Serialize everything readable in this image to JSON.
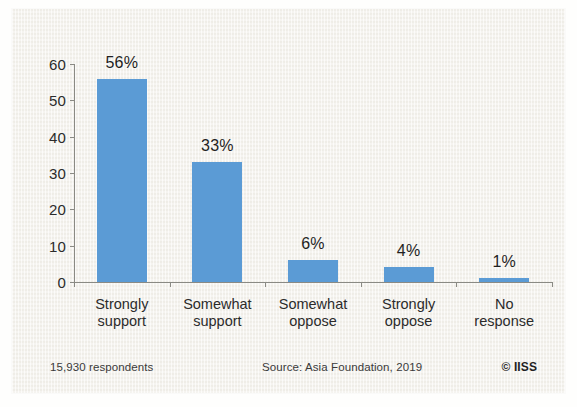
{
  "chart_data": {
    "type": "bar",
    "title": "",
    "subtitle": "",
    "xlabel": "",
    "ylabel": "",
    "ylim": [
      0,
      60
    ],
    "yticks": [
      0,
      10,
      20,
      30,
      40,
      50,
      60
    ],
    "ytick_labels": [
      "0",
      "10",
      "20",
      "30",
      "40",
      "50",
      "60"
    ],
    "grid": false,
    "legend": null,
    "categories": [
      "Strongly support",
      "Somewhat support",
      "Somewhat oppose",
      "Strongly oppose",
      "No response"
    ],
    "category_lines": [
      [
        "Strongly",
        "support"
      ],
      [
        "Somewhat",
        "support"
      ],
      [
        "Somewhat",
        "oppose"
      ],
      [
        "Strongly",
        "oppose"
      ],
      [
        "No",
        "response"
      ]
    ],
    "values": [
      56,
      33,
      6,
      4,
      1
    ],
    "data_labels": [
      "56%",
      "33%",
      "6%",
      "4%",
      "1%"
    ],
    "bar_color": "#5b9bd5"
  },
  "footer": {
    "respondents": "15,930 respondents",
    "source": "Source: Asia Foundation, 2019",
    "copyright": "© IISS"
  },
  "colors": {
    "bar": "#5b9bd5",
    "panel_background": "#f4f2ec",
    "axis": "#8a8a84",
    "text": "#2b2b2b"
  }
}
